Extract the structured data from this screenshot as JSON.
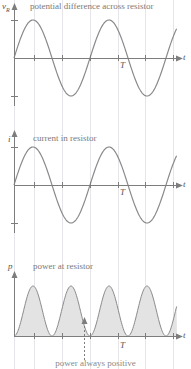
{
  "figure": {
    "width": 191,
    "height": 369,
    "background": "#ffffff",
    "grid_color": "#e6e6ea",
    "axis_color": "#7d7d7d",
    "curve_color": "#8a8a8a",
    "fill_color": "#e3e3e3",
    "text_color": "#7a7a7a",
    "gridline_x": [
      14,
      34,
      62,
      90,
      118,
      145,
      173
    ]
  },
  "panels": [
    {
      "id": "voltage",
      "title": "potential difference across resistor",
      "y_axis_label": "v",
      "y_axis_label_sub": "R",
      "x_axis_label": "t",
      "period_label": "T",
      "baseline_y": 58,
      "amplitude": 38,
      "axis_x0": 14,
      "axis_x1": 178,
      "tick_x": [
        34,
        62,
        90,
        118,
        145,
        173
      ],
      "ytick_up": 38,
      "ytick_down": 38
    },
    {
      "id": "current",
      "title": "current in resistor",
      "y_axis_label": "i",
      "y_axis_label_sub": "",
      "x_axis_label": "t",
      "period_label": "T",
      "baseline_y": 185,
      "amplitude": 38,
      "axis_x0": 14,
      "axis_x1": 178,
      "tick_x": [
        34,
        62,
        90,
        118,
        145,
        173
      ],
      "ytick_up": 38,
      "ytick_down": 38
    },
    {
      "id": "power",
      "title": "power at resistor",
      "y_axis_label": "p",
      "y_axis_label_sub": "",
      "x_axis_label": "t",
      "period_label": "T",
      "baseline_y": 336,
      "amplitude": 50,
      "axis_x0": 14,
      "axis_x1": 178,
      "tick_x": [
        34,
        62,
        90,
        118,
        145,
        173
      ],
      "filled": true,
      "annotation_arrow_x": 84
    }
  ],
  "footnote": "power always positive",
  "chart_data": {
    "type": "line",
    "xlabel": "t",
    "ylabel": "",
    "grid": true,
    "legend": "none",
    "x": [
      0,
      0.125,
      0.25,
      0.375,
      0.5,
      0.625,
      0.75,
      0.875,
      1.0,
      1.125,
      1.25,
      1.375,
      1.5
    ],
    "xlim": [
      0,
      1.5
    ],
    "x_tick_labels": [
      "",
      "",
      "",
      "",
      "",
      "",
      "T",
      "",
      ""
    ],
    "series": [
      {
        "name": "potential difference across resistor",
        "symbol": "v_R",
        "ylabel": "v_R",
        "ylim": [
          -1,
          1
        ],
        "form": "sin(2*pi*t/T)",
        "values": [
          0,
          0.707,
          1.0,
          0.707,
          0,
          -0.707,
          -1.0,
          -0.707,
          0,
          0.707,
          1.0,
          0.707,
          0
        ]
      },
      {
        "name": "current in resistor",
        "symbol": "i",
        "ylabel": "i",
        "ylim": [
          -1,
          1
        ],
        "form": "sin(2*pi*t/T)",
        "values": [
          0,
          0.707,
          1.0,
          0.707,
          0,
          -0.707,
          -1.0,
          -0.707,
          0,
          0.707,
          1.0,
          0.707,
          0
        ]
      },
      {
        "name": "power at resistor",
        "symbol": "p",
        "ylabel": "p",
        "ylim": [
          0,
          1
        ],
        "form": "sin^2(2*pi*t/T)",
        "values": [
          0,
          0.5,
          1.0,
          0.5,
          0,
          0.5,
          1.0,
          0.5,
          0,
          0.5,
          1.0,
          0.5,
          0
        ]
      }
    ],
    "annotations": [
      {
        "text": "T",
        "meaning": "one period marker",
        "x": 0.75
      },
      {
        "text": "power always positive",
        "meaning": "caption with upward dotted arrow at a power minimum"
      }
    ]
  }
}
